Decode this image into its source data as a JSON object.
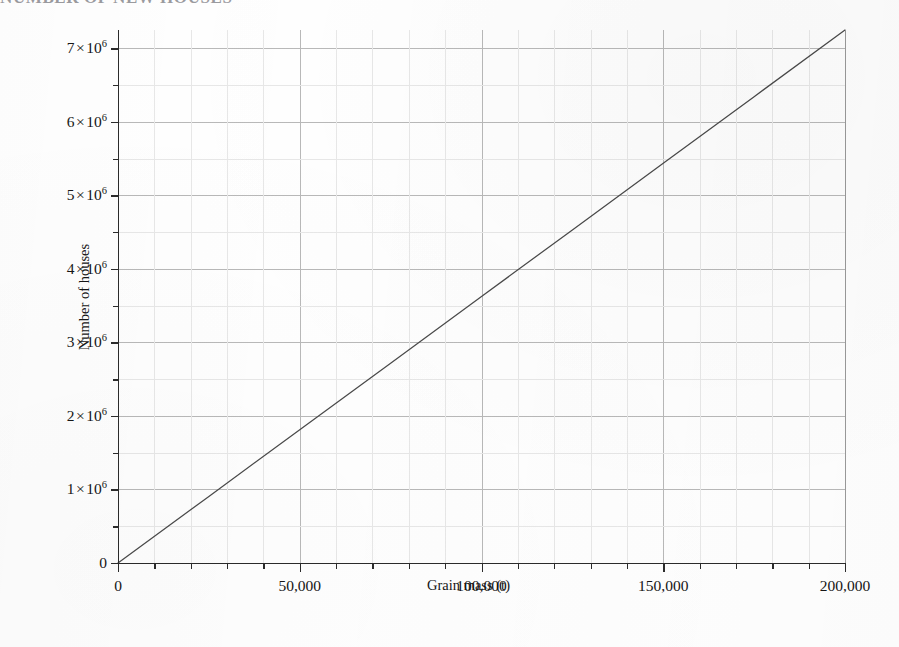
{
  "heading": {
    "text": "NUMBER OF NEW HOUSES"
  },
  "chart_data": {
    "type": "line",
    "title": "",
    "xlabel": "Grain mass (t)",
    "ylabel": "Number of houses",
    "xlim": [
      0,
      200000
    ],
    "ylim": [
      0,
      7250000
    ],
    "grid": true,
    "legend": false,
    "x_tick_labels": [
      "0",
      "50,000",
      "100,000",
      "150,000",
      "200,000"
    ],
    "x_tick_values": [
      0,
      50000,
      100000,
      150000,
      200000
    ],
    "x_minor_step": 10000,
    "y_tick_labels": [
      "0",
      "1 × 10⁶",
      "2 × 10⁶",
      "3 × 10⁶",
      "4 × 10⁶",
      "5 × 10⁶",
      "6 × 10⁶",
      "7 × 10⁶"
    ],
    "y_tick_values": [
      0,
      1000000,
      2000000,
      3000000,
      4000000,
      5000000,
      6000000,
      7000000
    ],
    "y_minor_step": 500000,
    "series": [
      {
        "name": "Number of houses",
        "color": "#4a4a4a",
        "x": [
          0,
          25000,
          50000,
          75000,
          100000,
          125000,
          150000,
          175000,
          200000
        ],
        "values": [
          0,
          906250,
          1812500,
          2718750,
          3625000,
          4531250,
          5437500,
          6343750,
          7250000
        ]
      }
    ]
  },
  "ytick_parts": [
    {
      "mantissa": "0",
      "times": "",
      "base": "",
      "exp": ""
    },
    {
      "mantissa": "1",
      "times": "×",
      "base": "10",
      "exp": "6"
    },
    {
      "mantissa": "2",
      "times": "×",
      "base": "10",
      "exp": "6"
    },
    {
      "mantissa": "3",
      "times": "×",
      "base": "10",
      "exp": "6"
    },
    {
      "mantissa": "4",
      "times": "×",
      "base": "10",
      "exp": "6"
    },
    {
      "mantissa": "5",
      "times": "×",
      "base": "10",
      "exp": "6"
    },
    {
      "mantissa": "6",
      "times": "×",
      "base": "10",
      "exp": "6"
    },
    {
      "mantissa": "7",
      "times": "×",
      "base": "10",
      "exp": "6"
    }
  ]
}
